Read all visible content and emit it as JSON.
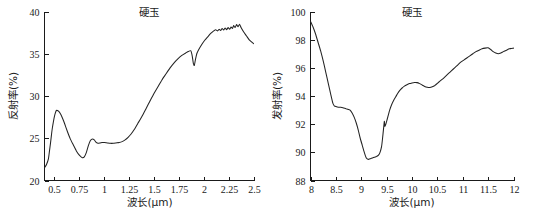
{
  "figure": {
    "name": "jadeite-spectral-curves",
    "panel_count": 2
  },
  "chart_data": [
    {
      "type": "line",
      "panel": "left",
      "title": "硬玉",
      "xlabel": "波长(μm)",
      "ylabel": "反射率(%)",
      "xlim": [
        0.4,
        2.5
      ],
      "ylim": [
        20,
        40
      ],
      "xticks": [
        "0.5",
        "0.75",
        "1",
        "1.25",
        "1.5",
        "1.75",
        "2",
        "2.25",
        "2.5"
      ],
      "xtick_values": [
        0.5,
        0.75,
        1,
        1.25,
        1.5,
        1.75,
        2,
        2.25,
        2.5
      ],
      "yticks": [
        "20",
        "25",
        "30",
        "35",
        "40"
      ],
      "ytick_values": [
        20,
        25,
        30,
        35,
        40
      ],
      "grid": false,
      "legend": null,
      "series": [
        {
          "name": "反射率",
          "color": "#232323",
          "x": [
            0.4,
            0.42,
            0.44,
            0.45,
            0.46,
            0.47,
            0.48,
            0.5,
            0.52,
            0.54,
            0.56,
            0.58,
            0.6,
            0.63,
            0.66,
            0.69,
            0.72,
            0.75,
            0.78,
            0.8,
            0.82,
            0.84,
            0.86,
            0.88,
            0.9,
            0.92,
            0.94,
            0.96,
            0.98,
            1.0,
            1.03,
            1.06,
            1.09,
            1.12,
            1.15,
            1.18,
            1.21,
            1.24,
            1.27,
            1.3,
            1.34,
            1.38,
            1.42,
            1.46,
            1.5,
            1.54,
            1.58,
            1.62,
            1.66,
            1.7,
            1.74,
            1.78,
            1.82,
            1.85,
            1.87,
            1.885,
            1.895,
            1.905,
            1.915,
            1.93,
            1.95,
            1.98,
            2.01,
            2.04,
            2.07,
            2.1,
            2.12,
            2.14,
            2.155,
            2.17,
            2.185,
            2.2,
            2.215,
            2.23,
            2.245,
            2.26,
            2.275,
            2.29,
            2.3,
            2.315,
            2.33,
            2.345,
            2.36,
            2.375,
            2.4,
            2.43,
            2.46,
            2.5
          ],
          "y": [
            21.5,
            21.9,
            22.6,
            23.5,
            24.4,
            25.4,
            26.3,
            27.6,
            28.3,
            28.2,
            27.9,
            27.4,
            26.8,
            25.8,
            24.9,
            24.2,
            23.5,
            23.0,
            22.7,
            22.8,
            23.3,
            24.1,
            24.7,
            24.9,
            24.8,
            24.5,
            24.4,
            24.45,
            24.5,
            24.5,
            24.45,
            24.4,
            24.4,
            24.45,
            24.5,
            24.6,
            24.8,
            25.1,
            25.5,
            26.0,
            26.8,
            27.6,
            28.5,
            29.4,
            30.3,
            31.1,
            31.9,
            32.6,
            33.3,
            33.9,
            34.4,
            34.8,
            35.1,
            35.3,
            35.35,
            34.7,
            33.9,
            33.6,
            34.2,
            35.0,
            35.5,
            36.1,
            36.6,
            37.0,
            37.4,
            37.7,
            37.85,
            37.7,
            37.9,
            37.75,
            38.0,
            37.8,
            38.05,
            37.85,
            38.1,
            37.9,
            38.15,
            38.0,
            38.35,
            38.1,
            38.45,
            38.2,
            38.5,
            38.1,
            37.6,
            37.1,
            36.6,
            36.2
          ]
        }
      ]
    },
    {
      "type": "line",
      "panel": "right",
      "title": "硬玉",
      "xlabel": "波长(μm)",
      "ylabel": "发射率(%)",
      "xlim": [
        8,
        12
      ],
      "ylim": [
        88,
        100
      ],
      "xticks": [
        "8",
        "8.5",
        "9",
        "9.5",
        "10",
        "10.5",
        "11",
        "11.5",
        "12"
      ],
      "xtick_values": [
        8,
        8.5,
        9,
        9.5,
        10,
        10.5,
        11,
        11.5,
        12
      ],
      "yticks": [
        "88",
        "90",
        "92",
        "94",
        "96",
        "98",
        "100"
      ],
      "ytick_values": [
        88,
        90,
        92,
        94,
        96,
        98,
        100
      ],
      "grid": false,
      "legend": null,
      "series": [
        {
          "name": "发射率",
          "color": "#232323",
          "x": [
            8.0,
            8.05,
            8.1,
            8.15,
            8.2,
            8.25,
            8.3,
            8.35,
            8.4,
            8.44,
            8.47,
            8.5,
            8.55,
            8.6,
            8.65,
            8.7,
            8.75,
            8.78,
            8.82,
            8.86,
            8.9,
            8.94,
            8.98,
            9.02,
            9.06,
            9.1,
            9.14,
            9.18,
            9.22,
            9.26,
            9.3,
            9.34,
            9.37,
            9.4,
            9.42,
            9.44,
            9.455,
            9.465,
            9.48,
            9.5,
            9.53,
            9.56,
            9.6,
            9.64,
            9.68,
            9.72,
            9.76,
            9.8,
            9.85,
            9.9,
            9.95,
            10.0,
            10.05,
            10.1,
            10.15,
            10.2,
            10.25,
            10.3,
            10.35,
            10.4,
            10.45,
            10.5,
            10.55,
            10.6,
            10.66,
            10.72,
            10.78,
            10.84,
            10.9,
            10.96,
            11.02,
            11.08,
            11.14,
            11.2,
            11.26,
            11.32,
            11.38,
            11.44,
            11.5,
            11.55,
            11.6,
            11.65,
            11.7,
            11.75,
            11.8,
            11.86,
            11.92,
            12.0
          ],
          "y": [
            99.3,
            98.9,
            98.4,
            97.8,
            97.2,
            96.5,
            95.7,
            94.9,
            94.1,
            93.5,
            93.3,
            93.25,
            93.2,
            93.2,
            93.15,
            93.1,
            93.05,
            93.0,
            92.8,
            92.5,
            92.1,
            91.6,
            91.0,
            90.5,
            90.0,
            89.6,
            89.5,
            89.55,
            89.6,
            89.65,
            89.7,
            89.8,
            90.0,
            90.4,
            91.0,
            91.7,
            92.2,
            91.85,
            91.95,
            92.2,
            92.6,
            93.0,
            93.4,
            93.7,
            93.95,
            94.2,
            94.4,
            94.55,
            94.7,
            94.8,
            94.88,
            94.93,
            94.96,
            94.95,
            94.88,
            94.78,
            94.68,
            94.62,
            94.6,
            94.65,
            94.75,
            94.9,
            95.05,
            95.2,
            95.4,
            95.6,
            95.8,
            96.0,
            96.2,
            96.4,
            96.55,
            96.7,
            96.85,
            97.0,
            97.15,
            97.25,
            97.35,
            97.4,
            97.42,
            97.3,
            97.15,
            97.05,
            97.0,
            97.05,
            97.15,
            97.25,
            97.35,
            97.4
          ]
        }
      ]
    }
  ]
}
